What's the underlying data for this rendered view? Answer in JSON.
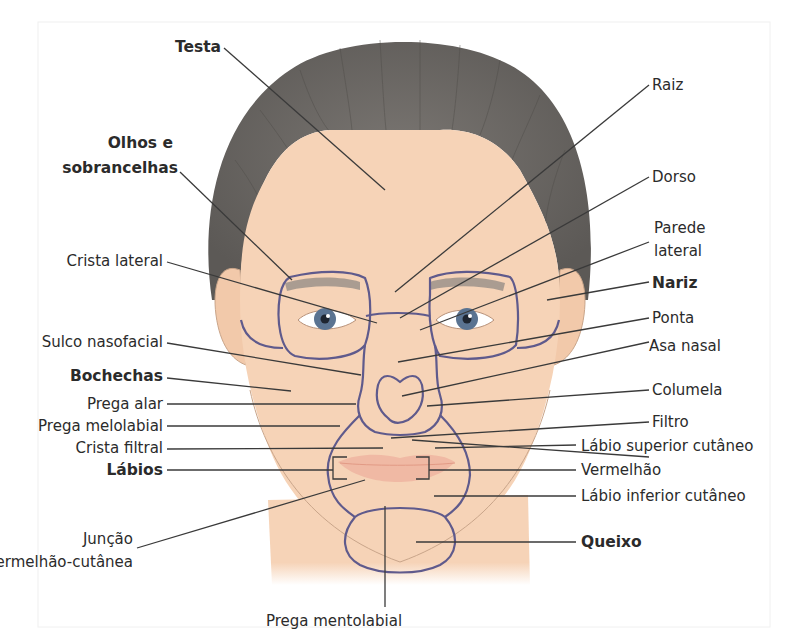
{
  "diagram": {
    "colors": {
      "background": "#ffffff",
      "skin": "#f6d3b7",
      "skin_shadow": "#ebbf9d",
      "hair": "#6e6a66",
      "hair_dark": "#55524f",
      "region_outline": "#5f5a8c",
      "leader_line": "#3a3a3a",
      "text": "#2b2b2b",
      "iris": "#5a7391",
      "lips": "#f0b9a4"
    },
    "labels_left": {
      "testa": "Testa",
      "olhos_line1": "Olhos e",
      "olhos_line2": "sobrancelhas",
      "crista_lateral": "Crista lateral",
      "sulco_nasofacial": "Sulco nasofacial",
      "bochechas": "Bochechas",
      "prega_alar": "Prega alar",
      "prega_melolabial": "Prega melolabial",
      "crista_filtral": "Crista filtral",
      "labios": "Lábios",
      "juncao_line1": "Junção",
      "juncao_line2": "vermelhão-cutânea"
    },
    "labels_right": {
      "raiz": "Raiz",
      "dorso": "Dorso",
      "parede_line1": "Parede",
      "parede_line2": "lateral",
      "nariz": "Nariz",
      "ponta": "Ponta",
      "asa_nasal": "Asa nasal",
      "columela": "Columela",
      "filtro": "Filtro",
      "labio_superior": "Lábio superior cutâneo",
      "vermelhao": "Vermelhão",
      "labio_inferior": "Lábio inferior cutâneo",
      "queixo": "Queixo"
    },
    "labels_bottom": {
      "prega_mentolabial": "Prega mentolabial"
    }
  }
}
